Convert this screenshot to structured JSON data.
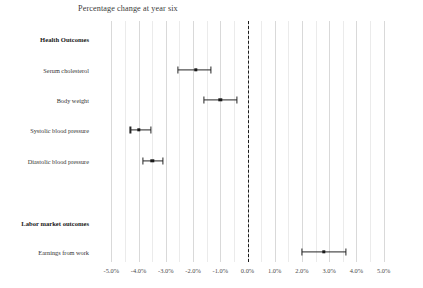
{
  "chart_data": {
    "type": "scatter",
    "title": "Percentage change at year six",
    "xlabel": "",
    "ylabel": "",
    "xlim": [
      -5.6,
      5.6
    ],
    "xticks": [
      -5.0,
      -4.0,
      -3.0,
      -2.0,
      -1.0,
      0.0,
      1.0,
      2.0,
      3.0,
      4.0,
      5.0
    ],
    "xticklabels": [
      "-5.0%",
      "-4.0%",
      "-3.0%",
      "-2.0%",
      "-1.0%",
      "0.0%",
      "1.0%",
      "2.0%",
      "3.0%",
      "4.0%",
      "5.0%"
    ],
    "grid": true,
    "grid_axis": "x",
    "legend": "none",
    "reference_line": {
      "value": 0.0,
      "style": "dashed",
      "color": "#1a1a1a"
    },
    "marker_color": "#1a1a1a",
    "line_color": "#262626",
    "rows": [
      {
        "label": "Health Outcomes",
        "type": "group",
        "value": null,
        "ci_low": null,
        "ci_high": null
      },
      {
        "label": "Serum cholesterol",
        "type": "estimate",
        "value": -1.9,
        "ci_low": -2.55,
        "ci_high": -1.35
      },
      {
        "label": "Body weight",
        "type": "estimate",
        "value": -1.0,
        "ci_low": -1.6,
        "ci_high": -0.4
      },
      {
        "label": "Systolic blood pressure",
        "type": "estimate",
        "value": -4.0,
        "ci_low": -4.3,
        "ci_high": -3.55
      },
      {
        "label": "Diastolic blood pressure",
        "type": "estimate",
        "value": -3.5,
        "ci_low": -3.85,
        "ci_high": -3.1
      },
      {
        "label": "Labor market outcomes",
        "type": "group",
        "value": null,
        "ci_low": null,
        "ci_high": null
      },
      {
        "label": "Earnings from work",
        "type": "estimate",
        "value": 2.8,
        "ci_low": 2.0,
        "ci_high": 3.6
      }
    ]
  }
}
